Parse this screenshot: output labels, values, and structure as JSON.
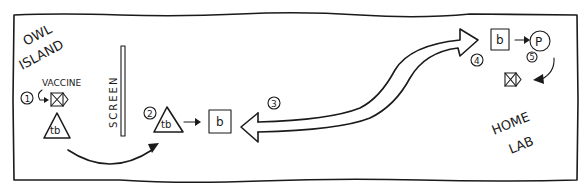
{
  "diagram": {
    "regions": {
      "left": {
        "label_line1": "OWL",
        "label_line2": "ISLAND"
      },
      "right": {
        "label_line1": "HOME",
        "label_line2": "LAB"
      }
    },
    "screen": {
      "label": "SCREEN"
    },
    "steps": [
      {
        "number": "1",
        "label": "VACCINE",
        "description": "vaccine box given to tb"
      },
      {
        "number": "2",
        "symbol": "tb",
        "target": "b",
        "description": "tb produces b"
      },
      {
        "number": "3",
        "description": "b sent from home lab to owl island"
      },
      {
        "number": "4",
        "symbol": "b",
        "description": "b arrives at home lab"
      },
      {
        "number": "5",
        "symbol": "P",
        "description": "P produces vaccine box"
      }
    ],
    "nodes": {
      "tb_left": "tb",
      "tb_mid": "tb",
      "b_mid": "b",
      "b_right": "b",
      "p_right": "P"
    },
    "colors": {
      "ink": "#1a1a1a",
      "background": "#ffffff"
    }
  }
}
